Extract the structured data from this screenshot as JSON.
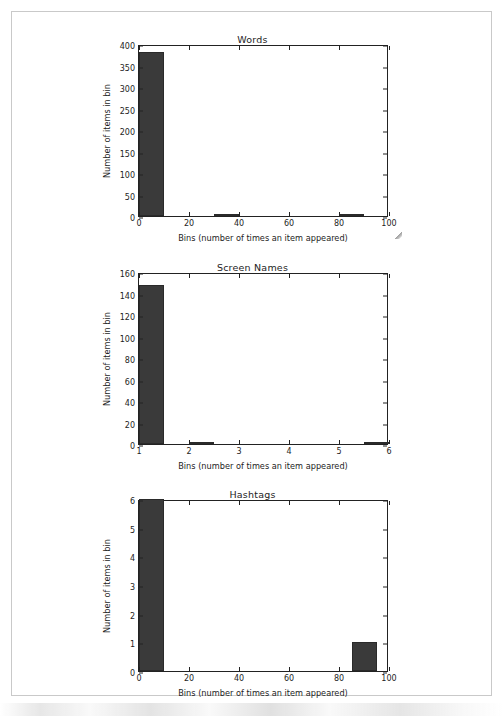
{
  "document": {
    "page_border_color": "#c9c9c9",
    "background_color": "#ffffff"
  },
  "figure": {
    "bar_color": "#3a3a3a",
    "axis_color": "#222222",
    "shared_xlabel": "Bins (number of times an item appeared)",
    "shared_ylabel": "Number of items in bin"
  },
  "chart_data": [
    {
      "type": "bar",
      "title": "Words",
      "xlabel": "Bins (number of times an item appeared)",
      "ylabel": "Number of items in bin",
      "xlim": [
        0,
        100
      ],
      "ylim": [
        0,
        400
      ],
      "xticks": [
        0,
        20,
        40,
        60,
        80,
        100
      ],
      "xtick_labels": [
        "0",
        "20",
        "40",
        "60",
        "80",
        "100"
      ],
      "yticks": [
        0,
        50,
        100,
        150,
        200,
        250,
        300,
        350,
        400
      ],
      "ytick_labels": [
        "0",
        "50",
        "100",
        "150",
        "200",
        "250",
        "300",
        "350",
        "400"
      ],
      "grid": false,
      "bin_edges": [
        0,
        10,
        20,
        30,
        40,
        50,
        60,
        70,
        80,
        90,
        100
      ],
      "values": [
        382,
        0,
        0,
        2,
        0,
        0,
        0,
        0,
        0,
        2
      ],
      "bars": [
        {
          "x0": 0,
          "x1": 10,
          "height": 382
        },
        {
          "x0": 30,
          "x1": 40,
          "height": 2
        },
        {
          "x0": 80,
          "x1": 90,
          "height": 2
        }
      ]
    },
    {
      "type": "bar",
      "title": "Screen Names",
      "xlabel": "Bins (number of times an item appeared)",
      "ylabel": "Number of items in bin",
      "xlim": [
        1,
        6
      ],
      "ylim": [
        0,
        160
      ],
      "xticks": [
        1,
        2,
        3,
        4,
        5,
        6
      ],
      "xtick_labels": [
        "1",
        "2",
        "3",
        "4",
        "5",
        "6"
      ],
      "yticks": [
        0,
        20,
        40,
        60,
        80,
        100,
        120,
        140,
        160
      ],
      "ytick_labels": [
        "0",
        "20",
        "40",
        "60",
        "80",
        "100",
        "120",
        "140",
        "160"
      ],
      "grid": false,
      "bin_edges": [
        1,
        1.5,
        2,
        2.5,
        3,
        3.5,
        4,
        4.5,
        5,
        5.5,
        6
      ],
      "values": [
        148,
        0,
        2,
        0,
        0,
        0,
        0,
        0,
        0,
        1
      ],
      "bars": [
        {
          "x0": 1,
          "x1": 1.5,
          "height": 148
        },
        {
          "x0": 2,
          "x1": 2.5,
          "height": 2
        },
        {
          "x0": 5.5,
          "x1": 6,
          "height": 1
        }
      ]
    },
    {
      "type": "bar",
      "title": "Hashtags",
      "xlabel": "Bins (number of times an item appeared)",
      "ylabel": "Number of items in bin",
      "xlim": [
        0,
        100
      ],
      "ylim": [
        0,
        6
      ],
      "xticks": [
        0,
        20,
        40,
        60,
        80,
        100
      ],
      "xtick_labels": [
        "0",
        "20",
        "40",
        "60",
        "80",
        "100"
      ],
      "yticks": [
        0,
        1,
        2,
        3,
        4,
        5,
        6
      ],
      "ytick_labels": [
        "0",
        "1",
        "2",
        "3",
        "4",
        "5",
        "6"
      ],
      "grid": false,
      "bin_edges": [
        0,
        10,
        20,
        30,
        40,
        50,
        60,
        70,
        80,
        90,
        100
      ],
      "values": [
        6,
        0,
        0,
        0,
        0,
        0,
        0,
        0,
        1,
        0
      ],
      "bars": [
        {
          "x0": 0,
          "x1": 10,
          "height": 6
        },
        {
          "x0": 85,
          "x1": 95,
          "height": 1
        }
      ]
    }
  ]
}
